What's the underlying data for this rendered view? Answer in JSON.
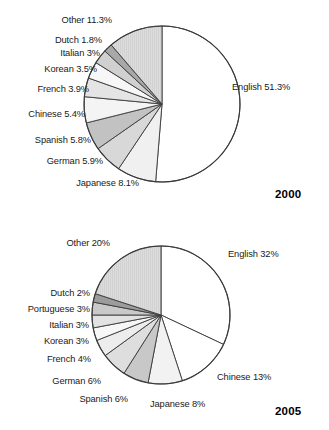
{
  "figure": {
    "background": "#ffffff",
    "outline_color": "#3a3a3a"
  },
  "chart_data": [
    {
      "type": "pie",
      "title": "2000",
      "year_label": "2000",
      "categories": [
        "English",
        "Japanese",
        "German",
        "Spanish",
        "Chinese",
        "French",
        "Korean",
        "Italian",
        "Dutch",
        "Other"
      ],
      "values": [
        51.3,
        8.1,
        5.9,
        5.8,
        5.4,
        3.9,
        3.5,
        3.0,
        1.8,
        11.3
      ],
      "labels": [
        "English 51.3%",
        "Japanese 8.1%",
        "German 5.9%",
        "Spanish 5.8%",
        "Chinese 5.4%",
        "French 3.9%",
        "Korean 3.5%",
        "Italian 3%",
        "Dutch 1.8%",
        "Other 11.3%"
      ],
      "slice_colors": [
        "#ffffff",
        "#f0f0f0",
        "#d8d8d8",
        "#c2c2c2",
        "#f4f4f4",
        "#e4e4e4",
        "#f7f7f7",
        "#d0d0d0",
        "#a8a8a8",
        "#dcdcdc"
      ],
      "start_angle_deg": 0,
      "direction": "clockwise",
      "legend": "none",
      "grid": false
    },
    {
      "type": "pie",
      "title": "2005",
      "year_label": "2005",
      "categories": [
        "English",
        "Chinese",
        "Japanese",
        "Spanish",
        "German",
        "French",
        "Korean",
        "Italian",
        "Portuguese",
        "Dutch",
        "Other"
      ],
      "values": [
        32,
        13,
        8,
        6,
        6,
        4,
        3,
        3,
        3,
        2,
        20
      ],
      "labels": [
        "English 32%",
        "Chinese 13%",
        "Japanese 8%",
        "Spanish 6%",
        "German 6%",
        "French 4%",
        "Korean 3%",
        "Italian 3%",
        "Portuguese 3%",
        "Dutch 2%",
        "Other 20%"
      ],
      "slice_colors": [
        "#ffffff",
        "#ffffff",
        "#f2f2f2",
        "#c8c8c8",
        "#dedede",
        "#ededed",
        "#f7f7f7",
        "#e2e2e2",
        "#c9c9c9",
        "#9c9c9c",
        "#dcdcdc"
      ],
      "start_angle_deg": 0,
      "direction": "clockwise",
      "legend": "none",
      "grid": false
    }
  ]
}
